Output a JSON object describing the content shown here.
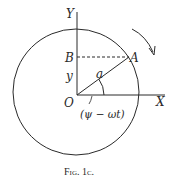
{
  "figure": {
    "caption": "Fig. 1c.",
    "labels": {
      "y_axis": "Y",
      "x_axis": "X",
      "origin": "O",
      "point_a": "A",
      "point_b": "B",
      "y_length": "y",
      "radius": "a",
      "angle": "(ψ − ωt)"
    },
    "colors": {
      "stroke": "#2a2a2a",
      "background": "#ffffff"
    },
    "geometry": {
      "circle_center": [
        76,
        91
      ],
      "circle_radius": 63,
      "origin": [
        77,
        95
      ],
      "point_a": [
        129,
        57
      ],
      "point_b": [
        77,
        57
      ],
      "rotation_direction": "clockwise"
    }
  }
}
